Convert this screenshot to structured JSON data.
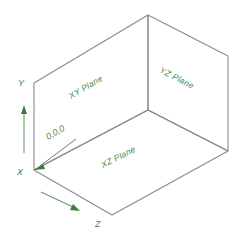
{
  "diagram": {
    "line_color": "#8a8a8a",
    "label_color": "#4a8a4a",
    "background": "#ffffff",
    "planes": [
      {
        "id": "xy",
        "label": "XY Plane"
      },
      {
        "id": "yz",
        "label": "YZ Plane"
      },
      {
        "id": "xz",
        "label": "XZ Plane"
      }
    ],
    "axes": [
      {
        "id": "y",
        "label": "Y"
      },
      {
        "id": "x",
        "label": "X"
      },
      {
        "id": "z",
        "label": "Z"
      }
    ],
    "origin": {
      "label": "0,0,0"
    }
  }
}
